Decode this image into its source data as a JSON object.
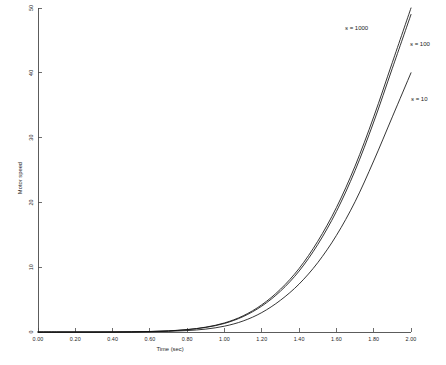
{
  "chart_data": {
    "type": "line",
    "title": "",
    "xlabel": "Time (sec)",
    "ylabel": "Motor speed",
    "xlim": [
      0,
      2.0
    ],
    "ylim": [
      0,
      50
    ],
    "grid": false,
    "legend_position": "inline-right",
    "xticks": [
      "0.00",
      "0.20",
      "0.40",
      "0.60",
      "0.80",
      "1.00",
      "1.20",
      "1.40",
      "1.60",
      "1.80",
      "2.00"
    ],
    "xtick_values": [
      0,
      0.2,
      0.4,
      0.6,
      0.8,
      1.0,
      1.2,
      1.4,
      1.6,
      1.8,
      2.0
    ],
    "yticks": [
      "0",
      "10",
      "20",
      "30",
      "40",
      "50"
    ],
    "ytick_values": [
      0,
      10,
      20,
      30,
      40,
      50
    ],
    "x": [
      0.0,
      0.1,
      0.2,
      0.3,
      0.4,
      0.5,
      0.6,
      0.7,
      0.8,
      0.9,
      1.0,
      1.1,
      1.2,
      1.3,
      1.4,
      1.5,
      1.6,
      1.7,
      1.8,
      1.9,
      2.0
    ],
    "series": [
      {
        "name": "s = 1000",
        "label_symbol": "s",
        "label_value": "1000",
        "color": "#111111",
        "values": [
          0.0,
          0.0,
          0.0,
          0.0,
          0.01,
          0.03,
          0.08,
          0.18,
          0.38,
          0.75,
          1.4,
          2.5,
          4.2,
          6.6,
          9.8,
          14.0,
          19.2,
          25.6,
          33.2,
          41.6,
          50.0
        ]
      },
      {
        "name": "s = 100",
        "label_symbol": "s",
        "label_value": "100",
        "color": "#111111",
        "values": [
          0.0,
          0.0,
          0.0,
          0.0,
          0.01,
          0.03,
          0.07,
          0.17,
          0.36,
          0.71,
          1.32,
          2.38,
          4.0,
          6.3,
          9.4,
          13.5,
          18.6,
          24.9,
          32.4,
          40.7,
          49.0
        ]
      },
      {
        "name": "s = 10",
        "label_symbol": "s",
        "label_value": "10",
        "color": "#111111",
        "values": [
          0.0,
          0.0,
          0.0,
          0.0,
          0.0,
          0.01,
          0.04,
          0.1,
          0.22,
          0.45,
          0.9,
          1.7,
          3.0,
          4.9,
          7.4,
          10.7,
          14.9,
          20.1,
          26.4,
          33.2,
          40.0
        ]
      }
    ]
  },
  "axis": {
    "x_title": "Time (sec)",
    "y_title": "Motor speed"
  },
  "labels": {
    "s1000_prefix": "s",
    "s1000_eq": " = 1000",
    "s100_prefix": "s",
    "s100_eq": " = 100",
    "s10_prefix": "s",
    "s10_eq": " = 10"
  }
}
